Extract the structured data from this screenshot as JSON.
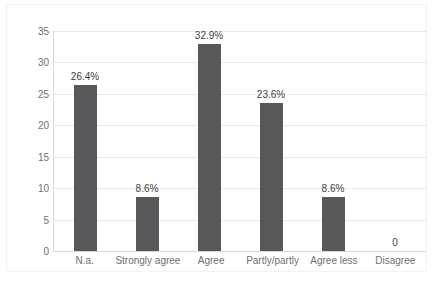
{
  "chart_data": {
    "type": "bar",
    "title": "",
    "xlabel": "",
    "ylabel": "",
    "categories": [
      "N.a.",
      "Strongly agree",
      "Agree",
      "Partly/partly",
      "Agree less",
      "Disagree"
    ],
    "values": [
      26.4,
      8.6,
      32.9,
      23.6,
      8.6,
      0
    ],
    "data_labels": [
      "26.4%",
      "8.6%",
      "32.9%",
      "23.6%",
      "8.6%",
      "0"
    ],
    "ylim": [
      0,
      35
    ],
    "yticks": [
      0,
      5,
      10,
      15,
      20,
      25,
      30,
      35
    ],
    "ytick_labels": [
      "0",
      "5",
      "10",
      "15",
      "20",
      "25",
      "30",
      "35"
    ],
    "grid": true,
    "legend": false,
    "series": [
      {
        "name": "",
        "values": [
          26.4,
          8.6,
          32.9,
          23.6,
          8.6,
          0
        ]
      }
    ],
    "colors": {
      "bar": "#58585a",
      "gridline": "#e9e9e9",
      "axis": "#d9d9d9",
      "tick_text": "#6f6f6f",
      "label_text": "#3d3d3d",
      "background": "#ffffff",
      "frame": "#f2f2f2"
    }
  }
}
